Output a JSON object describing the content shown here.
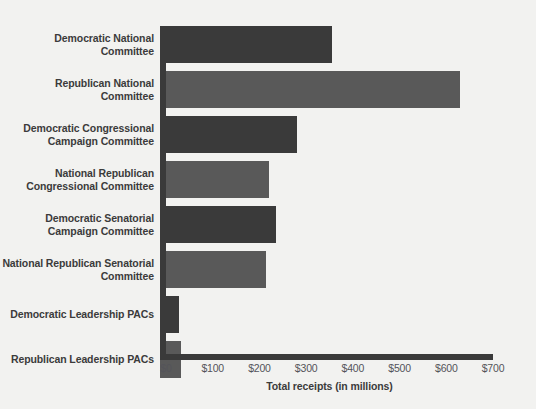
{
  "chart_data": {
    "type": "bar",
    "orientation": "horizontal",
    "title": "",
    "xlabel": "Total receipts (in millions)",
    "ylabel": "",
    "xlim": [
      0,
      700
    ],
    "xticks": [
      "$0",
      "$100",
      "$200",
      "$300",
      "$400",
      "$500",
      "$600",
      "$700"
    ],
    "xtick_values": [
      0,
      100,
      200,
      300,
      400,
      500,
      600,
      700
    ],
    "grid": false,
    "legend": "none",
    "categories": [
      "Democratic National Committee",
      "Republican National Committee",
      "Democratic Congressional Campaign Committee",
      "National Republican Congressional Committee",
      "Democratic Senatorial Campaign Committee",
      "National Republican Senatorial Committee",
      "Democratic Leadership PACs",
      "Republican Leadership PACs"
    ],
    "values": [
      368,
      643,
      293,
      233,
      248,
      227,
      41,
      45
    ],
    "party": [
      "dem",
      "rep",
      "dem",
      "rep",
      "dem",
      "rep",
      "dem",
      "rep"
    ],
    "colors": {
      "dem": "#3a3a3a",
      "rep": "#595959",
      "axis": "#3a3a3a",
      "background": "#f2f2f0",
      "label_text": "#3b3b3b",
      "tick_text": "#54545a"
    }
  }
}
